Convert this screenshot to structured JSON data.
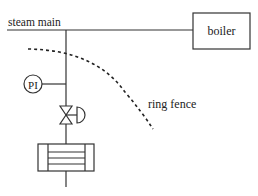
{
  "diagram": {
    "type": "process-flow",
    "labels": {
      "steam_main": "steam main",
      "boiler": "boiler",
      "pressure_indicator": "PI",
      "ring_fence": "ring fence"
    },
    "components": [
      {
        "id": "steam-main",
        "kind": "pipe",
        "label": "steam main"
      },
      {
        "id": "boiler",
        "kind": "box",
        "label": "boiler"
      },
      {
        "id": "pressure-indicator",
        "kind": "instrument",
        "label": "PI"
      },
      {
        "id": "control-valve",
        "kind": "valve-with-diaphragm-actuator"
      },
      {
        "id": "heat-exchanger",
        "kind": "shell-and-tube"
      },
      {
        "id": "ring-fence",
        "kind": "dashed-boundary",
        "label": "ring fence"
      }
    ],
    "colors": {
      "line": "#333333",
      "text": "#222222",
      "background": "#ffffff"
    }
  }
}
